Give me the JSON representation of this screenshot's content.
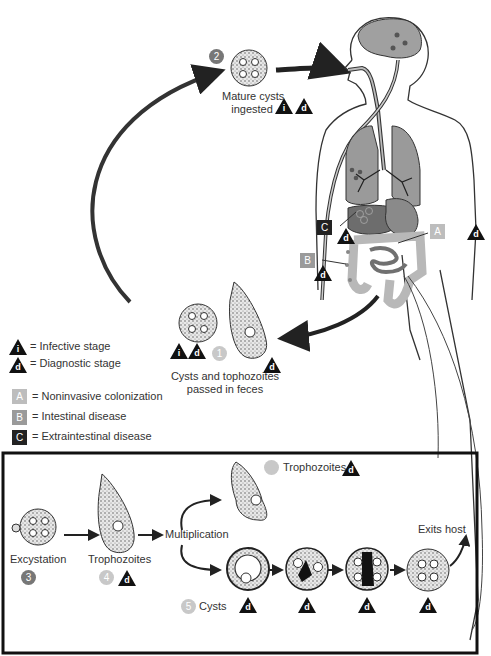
{
  "colors": {
    "infective_marker": "#111111",
    "diagnostic_marker": "#111111",
    "stage_A": "#bdbdbd",
    "stage_B": "#9a9a9a",
    "stage_C": "#222222",
    "step_2": "#777777",
    "step_3": "#777777",
    "step_light": "#c8c8c8",
    "organ_fill": "#9a9a9a"
  },
  "steps": {
    "s1": {
      "number": "1",
      "label_line1": "Cysts and tophozoites",
      "label_line2": "passed in feces"
    },
    "s2": {
      "number": "2",
      "label_line1": "Mature cysts",
      "label_line2": "ingested"
    },
    "s3": {
      "number": "3",
      "label": "Excystation"
    },
    "s4": {
      "number": "4",
      "label": "Trophozoites"
    },
    "s5": {
      "number": "5",
      "label": "Cysts"
    }
  },
  "bottom_panel": {
    "multiplication": "Multiplication",
    "trophozoites_label": "Trophozoites",
    "exits_host": "Exits host"
  },
  "markers": {
    "infective": "i",
    "diagnostic": "d"
  },
  "legend": {
    "infective": "= Infective stage",
    "diagnostic": "= Diagnostic stage",
    "A": {
      "letter": "A",
      "text": "= Noninvasive colonization"
    },
    "B": {
      "letter": "B",
      "text": "= Intestinal disease"
    },
    "C": {
      "letter": "C",
      "text": "= Extraintestinal disease"
    }
  },
  "body_labels": {
    "A": "A",
    "B": "B",
    "C": "C"
  }
}
